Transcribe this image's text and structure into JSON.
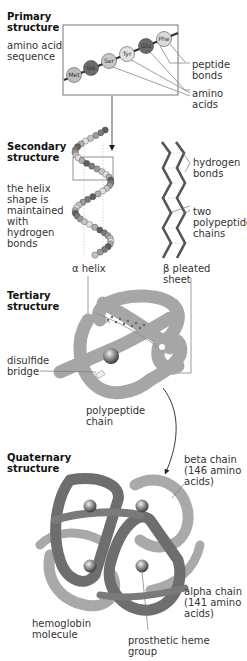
{
  "colors": {
    "dark_gray": "#5a5a5a",
    "mid_gray": "#8a8a8a",
    "light_gray": "#bdbdbd",
    "tertiary_fill": "#a8a8a8",
    "quaternary_dark": "#6e6e6e",
    "quaternary_light": "#a9a9a9",
    "line": "#777777"
  },
  "primary": {
    "heading": "Primary\nstructure",
    "description": "amino acid\nsequence",
    "amino_acids": [
      "Met",
      "Iso",
      "Ser",
      "Tyr",
      "Glu",
      "Phe"
    ],
    "label_peptide_bonds": "peptide\nbonds",
    "label_amino_acids": "amino\nacids"
  },
  "secondary": {
    "heading": "Secondary\nstructure",
    "description": "the helix\nshape is\nmaintained\nwith\nhydrogen\nbonds",
    "label_hydrogen_bonds": "hydrogen\nbonds",
    "label_two_chains": "two\npolypeptide\nchains",
    "label_alpha_helix": "α helix",
    "label_beta_sheet": "β pleated\nsheet"
  },
  "tertiary": {
    "heading": "Tertiary\nstructure",
    "label_disulfide": "disulfide\nbridge",
    "label_polypeptide": "polypeptide\nchain"
  },
  "quaternary": {
    "heading": "Quaternary\nstructure",
    "label_beta_chain": "beta chain\n(146 amino\nacids)",
    "label_alpha_chain": "alpha chain\n(141 amino\nacids)",
    "label_hemoglobin": "hemoglobin\nmolecule",
    "label_heme": "prosthetic heme\ngroup"
  }
}
